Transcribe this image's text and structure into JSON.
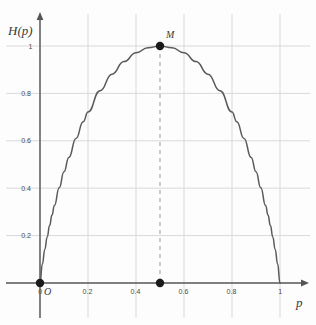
{
  "chart_data": {
    "type": "line",
    "title": "",
    "xlabel": "p",
    "ylabel": "H(p)",
    "xlim": [
      0,
      1.05
    ],
    "ylim": [
      0,
      1.08
    ],
    "grid": true,
    "legend": null,
    "x_ticks": [
      {
        "value": 0,
        "label": "0"
      },
      {
        "value": 0.2,
        "label": "0.2"
      },
      {
        "value": 0.4,
        "label": "0.4"
      },
      {
        "value": 0.6,
        "label": "0.6"
      },
      {
        "value": 0.8,
        "label": "0.8"
      },
      {
        "value": 1,
        "label": "1"
      }
    ],
    "y_ticks": [
      {
        "value": 0.2,
        "label": "0.2"
      },
      {
        "value": 0.4,
        "label": "0.4"
      },
      {
        "value": 0.6,
        "label": "0.6"
      },
      {
        "value": 0.8,
        "label": "0.8"
      },
      {
        "value": 1,
        "label": "1"
      }
    ],
    "series": [
      {
        "name": "H(p)",
        "color": "#5a5a5a",
        "x": [
          0,
          0.01,
          0.02,
          0.03,
          0.04,
          0.05,
          0.06,
          0.08,
          0.1,
          0.12,
          0.15,
          0.18,
          0.2,
          0.25,
          0.3,
          0.35,
          0.4,
          0.45,
          0.5,
          0.55,
          0.6,
          0.65,
          0.7,
          0.75,
          0.8,
          0.82,
          0.85,
          0.88,
          0.9,
          0.92,
          0.94,
          0.95,
          0.96,
          0.97,
          0.98,
          0.99,
          1
        ],
        "values": [
          0,
          0.0808,
          0.1414,
          0.1944,
          0.2423,
          0.2864,
          0.3274,
          0.4022,
          0.469,
          0.5294,
          0.6098,
          0.6801,
          0.7219,
          0.8113,
          0.8813,
          0.9341,
          0.971,
          0.9928,
          1,
          0.9928,
          0.971,
          0.9341,
          0.8813,
          0.8113,
          0.7219,
          0.6801,
          0.6098,
          0.5294,
          0.469,
          0.4022,
          0.3274,
          0.2864,
          0.2423,
          0.1944,
          0.1414,
          0.0808,
          0
        ]
      }
    ],
    "annotations": [
      {
        "name": "M",
        "label": "M",
        "x": 0.5,
        "y": 1,
        "marker": "filled-dot"
      },
      {
        "name": "O",
        "label": "O",
        "x": 0,
        "y": 0,
        "marker": "filled-dot"
      },
      {
        "name": "foot",
        "label": "",
        "x": 0.5,
        "y": 0,
        "marker": "filled-dot"
      }
    ],
    "guides": [
      {
        "type": "vertical-dashed",
        "x": 0.5,
        "y_from": 0,
        "y_to": 1,
        "color": "#aaaaaa"
      }
    ],
    "colors": {
      "curve": "#5a5a5a",
      "grid": "#d9d9d9",
      "axis": "#555555",
      "dashed_guide": "#aaaaaa",
      "marker": "#1a1a1a",
      "background": "#fdfdfd"
    }
  },
  "labels": {
    "y_axis_title_prefix": "H",
    "y_axis_title": "H(p)",
    "x_axis_title": "p",
    "origin": "O",
    "peak": "M"
  }
}
